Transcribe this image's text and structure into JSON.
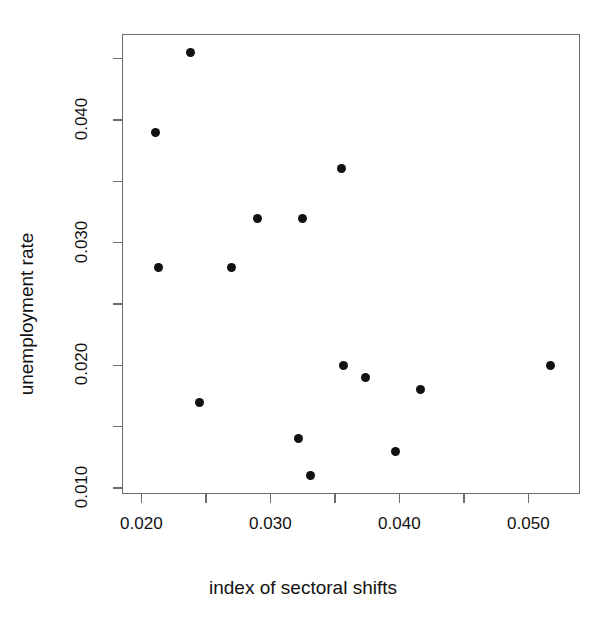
{
  "chart_data": {
    "type": "scatter",
    "title": "",
    "xlabel": "index of sectoral shifts",
    "ylabel": "unemployment rate",
    "xlim": [
      0.0185,
      0.054
    ],
    "ylim": [
      0.0095,
      0.047
    ],
    "grid": false,
    "legend": null,
    "marker": {
      "shape": "filled-circle",
      "color": "#111111",
      "size_px": 9
    },
    "xticks": [
      0.02,
      0.03,
      0.04,
      0.05
    ],
    "xtick_labels": [
      "0.020",
      "0.030",
      "0.040",
      "0.050"
    ],
    "xticks_minor": [
      0.025,
      0.035,
      0.045
    ],
    "yticks": [
      0.01,
      0.02,
      0.03,
      0.04
    ],
    "ytick_labels": [
      "0.010",
      "0.020",
      "0.030",
      "0.040"
    ],
    "yticks_minor": [
      0.015,
      0.025,
      0.035,
      0.045
    ],
    "n_points": 13,
    "points": [
      {
        "x": 0.0211,
        "y": 0.039
      },
      {
        "x": 0.0213,
        "y": 0.028
      },
      {
        "x": 0.0238,
        "y": 0.0455
      },
      {
        "x": 0.0245,
        "y": 0.017
      },
      {
        "x": 0.027,
        "y": 0.028
      },
      {
        "x": 0.029,
        "y": 0.032
      },
      {
        "x": 0.0322,
        "y": 0.014
      },
      {
        "x": 0.0325,
        "y": 0.032
      },
      {
        "x": 0.0331,
        "y": 0.011
      },
      {
        "x": 0.0355,
        "y": 0.036
      },
      {
        "x": 0.0357,
        "y": 0.02
      },
      {
        "x": 0.0374,
        "y": 0.019
      },
      {
        "x": 0.0397,
        "y": 0.013
      },
      {
        "x": 0.0416,
        "y": 0.018
      },
      {
        "x": 0.0517,
        "y": 0.02
      }
    ]
  },
  "axes": {
    "x_title": "index of sectoral shifts",
    "y_title": "unemployment rate"
  }
}
